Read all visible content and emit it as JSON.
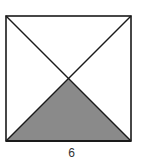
{
  "figure": {
    "shape": "square",
    "diagonals": 2,
    "shaded_region": "bottom triangle",
    "side_label": "6",
    "colors": {
      "stroke": "#1a1a1a",
      "shade": "#8a8a8a",
      "background": "#ffffff"
    }
  }
}
